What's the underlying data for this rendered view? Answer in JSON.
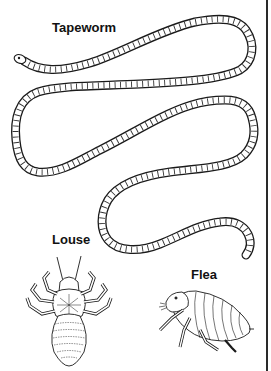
{
  "figure": {
    "labels": {
      "tapeworm": "Tapeworm",
      "louse": "Louse",
      "flea": "Flea"
    },
    "colors": {
      "ink": "#1a1a1a",
      "fill": "#ffffff",
      "background": "#ffffff",
      "rule": "#2a2a2a"
    },
    "illustrations": [
      {
        "name": "tapeworm",
        "type": "line-drawing",
        "description": "long segmented worm winding in S-curves from head at upper left"
      },
      {
        "name": "louse",
        "type": "line-drawing",
        "description": "dorsal view of louse with six clawed legs and segmented abdomen"
      },
      {
        "name": "flea",
        "type": "line-drawing",
        "description": "side view of flea with segmented body and jointed legs"
      }
    ]
  }
}
